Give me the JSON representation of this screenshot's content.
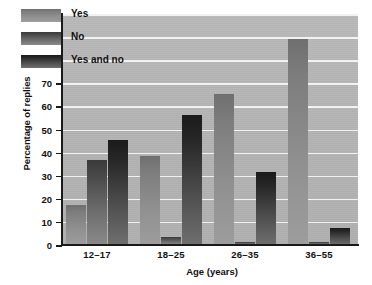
{
  "chart_data": {
    "type": "bar",
    "title": "",
    "xlabel": "Age (years)",
    "ylabel": "Percentage of replies",
    "categories": [
      "12–17",
      "18–25",
      "26–35",
      "36–55"
    ],
    "series": [
      {
        "name": "Yes",
        "values": [
          17.5,
          38.5,
          65.5,
          89.0
        ]
      },
      {
        "name": "No",
        "values": [
          37.0,
          3.5,
          1.5,
          1.5
        ]
      },
      {
        "name": "Yes and no",
        "values": [
          45.5,
          56.5,
          31.5,
          7.5
        ]
      }
    ],
    "ylim": [
      0,
      100
    ],
    "yticks": [
      0,
      10,
      20,
      30,
      40,
      50,
      60,
      70,
      80,
      90,
      100
    ],
    "ytick_labels": [
      "0",
      "10",
      "20",
      "30",
      "40",
      "50",
      "60",
      "70",
      "80",
      "90",
      "100"
    ],
    "grid": true,
    "grid_color": "#f2f2f2",
    "legend_position": "top-left",
    "plot_background": "#b4b4b4",
    "series_colors": [
      "#8d8d8d",
      "#5a5a5a",
      "#2b2b2b"
    ]
  },
  "legend": {
    "items": [
      {
        "label": "Yes",
        "swatch": "yes"
      },
      {
        "label": "No",
        "swatch": "no"
      },
      {
        "label": "Yes and no",
        "swatch": "yesno"
      }
    ]
  }
}
